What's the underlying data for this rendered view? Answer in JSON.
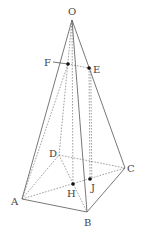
{
  "diagram": {
    "type": "pyramid",
    "vertices": {
      "O": "O",
      "A": "A",
      "B": "B",
      "C": "C",
      "D": "D",
      "E": "E",
      "F": "F",
      "H": "H",
      "J": "J"
    },
    "visible_edges": [
      "OA",
      "OB",
      "OC",
      "AB",
      "BC"
    ],
    "hidden_edges": [
      "OD",
      "AD",
      "DC",
      "AC",
      "DB",
      "OH",
      "EJ",
      "FE"
    ],
    "marked_points": [
      "E",
      "F",
      "H",
      "J"
    ]
  }
}
